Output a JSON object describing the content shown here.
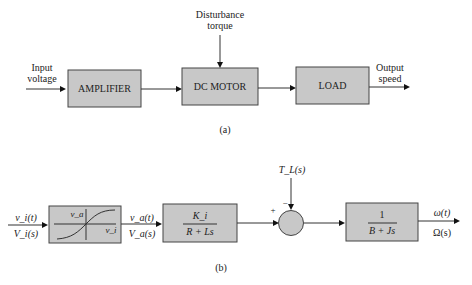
{
  "diagram_a": {
    "caption": "(a)",
    "input_label": [
      "Input",
      "voltage"
    ],
    "disturbance_label": [
      "Disturbance",
      "torque"
    ],
    "output_label": [
      "Output",
      "speed"
    ],
    "blocks": [
      {
        "label": "AMPLIFIER"
      },
      {
        "label": "DC MOTOR"
      },
      {
        "label": "LOAD"
      }
    ]
  },
  "diagram_b": {
    "caption": "(b)",
    "input_top": "v_i(t)",
    "input_bottom": "V_i(s)",
    "amp_curve_y_label": "v_a",
    "amp_curve_x_label": "v_i",
    "mid_top": "v_a(t)",
    "mid_bottom": "V_a(s)",
    "motor_block": {
      "numerator": "K_i",
      "denominator": "R + Ls"
    },
    "disturbance": "T_L(s)",
    "sum_signs": {
      "plus": "+",
      "minus": "−"
    },
    "load_block": {
      "numerator": "1",
      "denominator": "B + Js"
    },
    "output_top": "ω(t)",
    "output_bottom": "Ω(s)"
  },
  "colors": {
    "block_fill": "#c8c8c8",
    "line": "#333333"
  }
}
